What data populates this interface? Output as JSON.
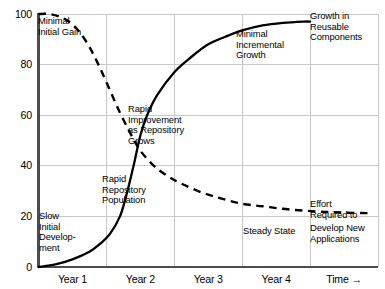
{
  "chart_data": {
    "type": "line",
    "title": "",
    "subtitle": "",
    "xlabel": "Time →",
    "ylabel": "",
    "xlim": [
      0,
      5
    ],
    "ylim": [
      0,
      100
    ],
    "grid": true,
    "legend_position": "none",
    "y_ticks": [
      0,
      20,
      40,
      60,
      80,
      100
    ],
    "y_tick_labels": [
      "0",
      "20",
      "40",
      "60",
      "80",
      "100"
    ],
    "x_tick_labels": [
      "Year 1",
      "Year 2",
      "Year 3",
      "Year 4",
      "Time →"
    ],
    "x_gridlines": [
      1,
      2,
      3,
      4
    ],
    "series": [
      {
        "name": "Growth in Reusable Components",
        "style": "solid",
        "color": "#000000",
        "x": [
          0.0,
          0.25,
          0.5,
          0.75,
          0.9,
          1.05,
          1.2,
          1.3,
          1.4,
          1.5,
          1.6,
          1.75,
          2.0,
          2.25,
          2.5,
          2.75,
          3.0,
          3.3,
          3.6,
          3.9,
          4.0
        ],
        "values": [
          0,
          1,
          3,
          6,
          9,
          13,
          20,
          29,
          40,
          52,
          60,
          68,
          77,
          83,
          88,
          91,
          93.5,
          95.5,
          96.5,
          97,
          97
        ]
      },
      {
        "name": "Effort Required to Develop New Applications",
        "style": "dashed",
        "color": "#000000",
        "x": [
          0.0,
          0.15,
          0.3,
          0.45,
          0.6,
          0.75,
          0.9,
          1.05,
          1.2,
          1.35,
          1.5,
          1.7,
          1.9,
          2.1,
          2.4,
          2.7,
          3.0,
          3.3,
          3.6,
          3.9,
          4.2,
          4.5,
          4.85
        ],
        "values": [
          100,
          100,
          99,
          97,
          93,
          87,
          79,
          70,
          61,
          53,
          46,
          40,
          36,
          33,
          29.5,
          27,
          25,
          24,
          23,
          22.3,
          21.8,
          21.5,
          21.3
        ]
      }
    ],
    "annotations": [
      {
        "id": "minimal-initial-gain",
        "text": "Minimal\nInitial Gain",
        "x": 38,
        "y": 16
      },
      {
        "id": "rapid-improvement",
        "text": "Rapid\nImprovement\nas Repository\nGrows",
        "x": 128,
        "y": 104
      },
      {
        "id": "minimal-incremental-growth",
        "text": "Minimal\nIncremental\nGrowth",
        "x": 236,
        "y": 29
      },
      {
        "id": "growth-in-reusable-components",
        "text": "Growth in\nReusable\nComponents",
        "x": 310,
        "y": 11
      },
      {
        "id": "slow-initial-development",
        "text": "Slow\nInitial\nDevelop-\nment",
        "x": 39,
        "y": 211
      },
      {
        "id": "rapid-repository-population",
        "text": "Rapid\nRepository\nPopulation",
        "x": 102,
        "y": 174
      },
      {
        "id": "steady-state",
        "text": "Steady State",
        "x": 243,
        "y": 226
      },
      {
        "id": "effort-required",
        "text": "Effort\nRequired to",
        "x": 310,
        "y": 199
      },
      {
        "id": "develop-new-applications",
        "text": "Develop New\nApplications",
        "x": 310,
        "y": 223
      }
    ]
  },
  "axes": {
    "axis_color": "#4d4d4d",
    "grid_color": "#c8c8c8",
    "curve_color": "#000000"
  }
}
